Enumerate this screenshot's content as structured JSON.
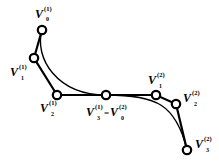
{
  "diagram": {
    "type": "bezier-curves",
    "colors": {
      "line": "#000000",
      "background": "#ffffff"
    },
    "control_points": [
      {
        "id": "V0_1",
        "base": "V",
        "sup": "(1)",
        "sub": "0",
        "x": 42,
        "y": 30,
        "label_x": 35,
        "label_y": 16
      },
      {
        "id": "V1_1",
        "base": "V",
        "sup": "(1)",
        "sub": "1",
        "x": 34,
        "y": 58,
        "label_x": 11,
        "label_y": 75
      },
      {
        "id": "V2_1",
        "base": "V",
        "sup": "(1)",
        "sub": "2",
        "x": 57,
        "y": 95,
        "label_x": 40,
        "label_y": 112
      },
      {
        "id": "V3_1",
        "base": "V",
        "sup": "(1)",
        "sub": "3",
        "x": 106,
        "y": 95,
        "label_x": 87,
        "label_y": 116
      },
      {
        "id": "V1_2",
        "base": "V",
        "sup": "(2)",
        "sub": "1",
        "x": 156,
        "y": 95,
        "label_x": 148,
        "label_y": 82
      },
      {
        "id": "V2_2",
        "base": "V",
        "sup": "(2)",
        "sub": "2",
        "x": 176,
        "y": 104,
        "label_x": 183,
        "label_y": 100
      },
      {
        "id": "V3_2",
        "base": "V",
        "sup": "(2)",
        "sub": "3",
        "x": 187,
        "y": 150,
        "label_x": 196,
        "label_y": 145
      }
    ],
    "joint_label": {
      "left": {
        "base": "V",
        "sup": "(1)",
        "sub": "3"
      },
      "equals": "=",
      "right": {
        "base": "V",
        "sup": "(2)",
        "sub": "0"
      }
    },
    "curves": [
      {
        "name": "segment-1",
        "from": "V0_1",
        "c1": "V1_1",
        "c2": "V2_1",
        "to": "V3_1"
      },
      {
        "name": "segment-2",
        "from": "V3_1",
        "c1": "V1_2",
        "c2": "V2_2",
        "to": "V3_2"
      }
    ]
  },
  "labels": {
    "v0_1": {
      "base": "V",
      "sup": "(1)",
      "sub": "0"
    },
    "v1_1": {
      "base": "V",
      "sup": "(1)",
      "sub": "1"
    },
    "v2_1": {
      "base": "V",
      "sup": "(1)",
      "sub": "2"
    },
    "v3_1": {
      "base": "V",
      "sup": "(1)",
      "sub": "3"
    },
    "eq": "=",
    "v0_2": {
      "base": "V",
      "sup": "(2)",
      "sub": "0"
    },
    "v1_2": {
      "base": "V",
      "sup": "(2)",
      "sub": "1"
    },
    "v2_2": {
      "base": "V",
      "sup": "(2)",
      "sub": "2"
    },
    "v3_2": {
      "base": "V",
      "sup": "(2)",
      "sub": "3"
    }
  }
}
